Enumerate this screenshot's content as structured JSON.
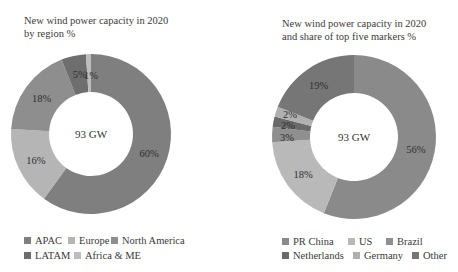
{
  "chart_data": [
    {
      "type": "donut",
      "title": "New wind power capacity in 2020\nby region %",
      "center_label": "93 GW",
      "categories": [
        "APAC",
        "Europe",
        "North America",
        "LATAM",
        "Africa & ME"
      ],
      "values": [
        60,
        16,
        18,
        5,
        1
      ],
      "value_labels": [
        "60%",
        "16%",
        "18%",
        "5%",
        "1%"
      ],
      "colors": [
        "#7f7f7f",
        "#b5b5b5",
        "#8e8e8e",
        "#6e6e6e",
        "#bdbdbd"
      ],
      "legend_position": "bottom",
      "start_angle": "12 o'clock, clockwise"
    },
    {
      "type": "donut",
      "title": "New wind power capacity in 2020\nand share of top five markers %",
      "center_label": "93 GW",
      "categories": [
        "PR China",
        "US",
        "Brazil",
        "Netherlands",
        "Germany",
        "Other"
      ],
      "values": [
        56,
        18,
        3,
        2,
        2,
        19
      ],
      "value_labels": [
        "56%",
        "18%",
        "3%",
        "2%",
        "2%",
        "19%"
      ],
      "colors": [
        "#8a8a8a",
        "#b9b9b9",
        "#8f8f8f",
        "#6a6a6a",
        "#b0b0b0",
        "#767676"
      ],
      "legend_position": "bottom",
      "start_angle": "12 o'clock, clockwise"
    }
  ],
  "left": {
    "title": "New wind power capacity in 2020\nby region %",
    "center_label": "93 GW",
    "legend": [
      {
        "label": "APAC",
        "color": "#7f7f7f"
      },
      {
        "label": "Europe",
        "color": "#b5b5b5"
      },
      {
        "label": "North America",
        "color": "#8e8e8e"
      },
      {
        "label": "LATAM",
        "color": "#6e6e6e"
      },
      {
        "label": "Africa & ME",
        "color": "#bdbdbd"
      }
    ]
  },
  "right": {
    "title": "New wind power capacity in 2020\nand share of top five markers %",
    "center_label": "93 GW",
    "legend": [
      {
        "label": "PR China",
        "color": "#8a8a8a"
      },
      {
        "label": "US",
        "color": "#b9b9b9"
      },
      {
        "label": "Brazil",
        "color": "#8f8f8f"
      },
      {
        "label": "Netherlands",
        "color": "#6a6a6a"
      },
      {
        "label": "Germany",
        "color": "#b0b0b0"
      },
      {
        "label": "Other",
        "color": "#767676"
      }
    ]
  }
}
